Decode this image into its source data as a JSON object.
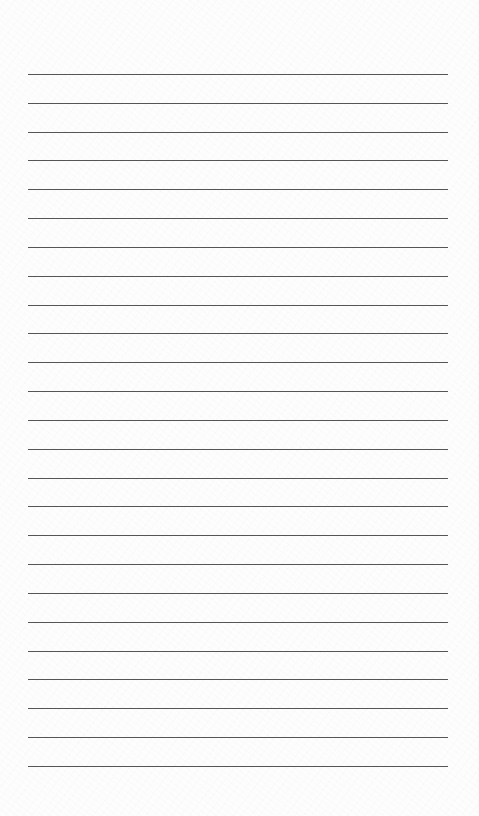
{
  "page": {
    "type": "lined-paper",
    "line_count": 25,
    "first_line_y": 74,
    "line_spacing": 28.83,
    "line_left": 28,
    "line_width": 420,
    "line_color": "#555555",
    "background_color": "#fdfdfd"
  }
}
